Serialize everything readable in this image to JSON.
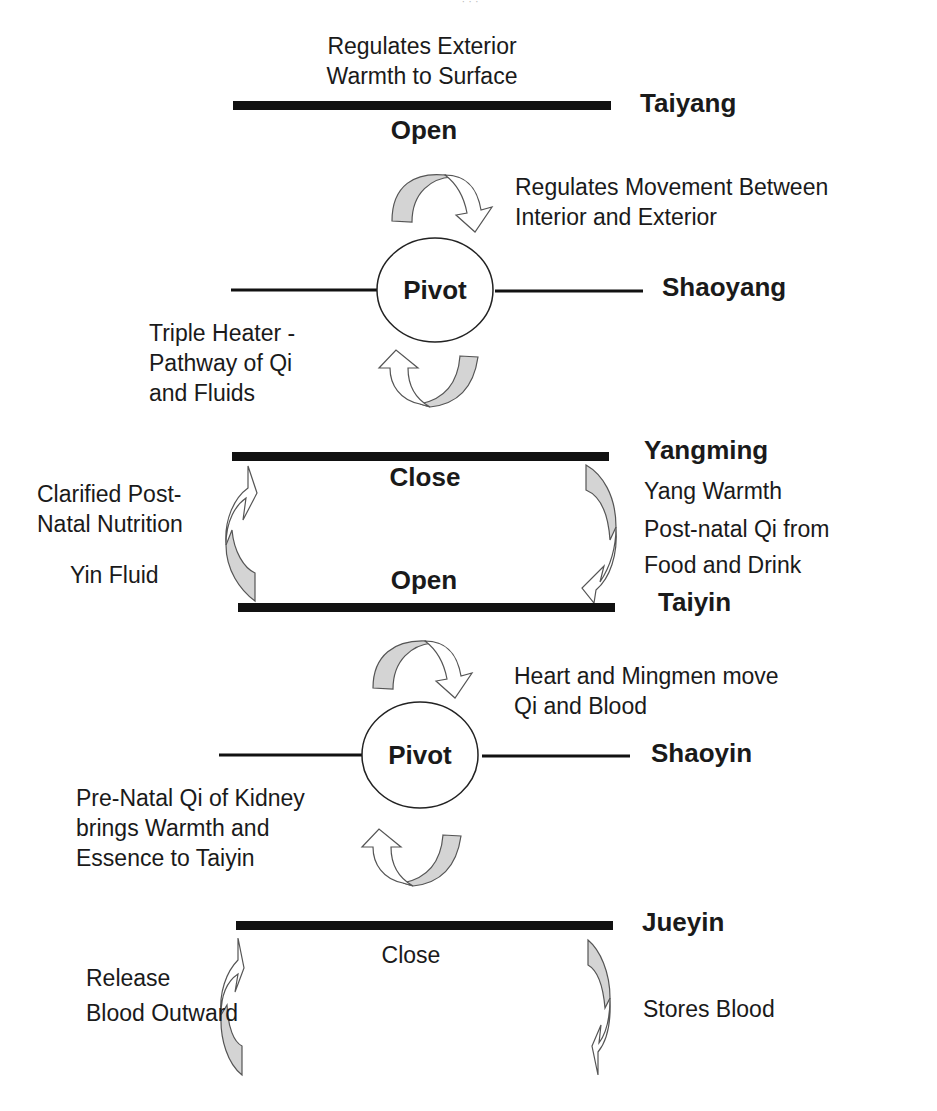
{
  "clipped_header": {
    "text": "· · ·"
  },
  "colors": {
    "bar": "#111111",
    "arrow_shade": "#d4d4d4",
    "text": "#1a1a1a"
  },
  "levels": {
    "taiyang": {
      "name": "Taiyang",
      "state": "Open",
      "note_lines": [
        "Regulates Exterior",
        "Warmth to Surface"
      ]
    },
    "shaoyang": {
      "name": "Shaoyang",
      "state": "Pivot",
      "note_right_lines": [
        "Regulates Movement Between",
        "Interior and Exterior"
      ],
      "note_left_lines": [
        "Triple Heater -",
        "Pathway of  Qi",
        "and Fluids"
      ]
    },
    "yangming": {
      "name": "Yangming",
      "state": "Close",
      "note_right_lines": [
        "Yang Warmth",
        "Post-natal Qi from",
        "Food and Drink"
      ]
    },
    "taiyin": {
      "name": "Taiyin",
      "state": "Open",
      "note_left_lines": [
        "Clarified Post-",
        "Natal Nutrition"
      ],
      "note_left_extra": "Yin Fluid"
    },
    "shaoyin": {
      "name": "Shaoyin",
      "state": "Pivot",
      "note_right_lines": [
        "Heart and Mingmen move",
        "Qi and Blood"
      ],
      "note_left_lines": [
        "Pre-Natal Qi of Kidney",
        "brings Warmth and",
        "Essence to Taiyin"
      ]
    },
    "jueyin": {
      "name": "Jueyin",
      "state": "Close",
      "note_left_lines": [
        "Release",
        "Blood Outward"
      ],
      "note_right": "Stores Blood"
    }
  }
}
